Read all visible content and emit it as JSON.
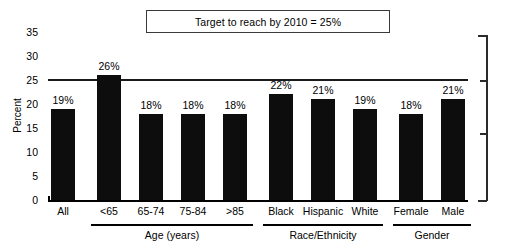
{
  "chart_data": {
    "type": "bar",
    "title": "Target to reach by 2010 = 25%",
    "xlabel": "",
    "ylabel": "Percent",
    "ylim": [
      0,
      35
    ],
    "yticks": [
      0,
      5,
      10,
      15,
      20,
      25,
      30,
      35
    ],
    "ytick_labels": [
      "0",
      "5",
      "10",
      "15",
      "20",
      "25",
      "30",
      "35"
    ],
    "grid": false,
    "legend": "none",
    "categories": [
      "All",
      "<65",
      "65-74",
      "75-84",
      ">85",
      "Black",
      "Hispanic",
      "White",
      "Female",
      "Male"
    ],
    "values": [
      19,
      26,
      18,
      18,
      18,
      22,
      21,
      19,
      18,
      21
    ],
    "value_labels": [
      "19%",
      "26%",
      "18%",
      "18%",
      "18%",
      "22%",
      "21%",
      "19%",
      "18%",
      "21%"
    ],
    "reference_line": {
      "value": 25,
      "label": "Target to reach by 2010 = 25%"
    },
    "groups": [
      {
        "label": "Age (years)",
        "categories": [
          "<65",
          "65-74",
          "75-84",
          ">85"
        ]
      },
      {
        "label": "Race/Ethnicity",
        "categories": [
          "Black",
          "Hispanic",
          "White"
        ]
      },
      {
        "label": "Gender",
        "categories": [
          "Female",
          "Male"
        ]
      }
    ],
    "bar_color": "#0d0d0d",
    "axis_color": "#000000"
  }
}
